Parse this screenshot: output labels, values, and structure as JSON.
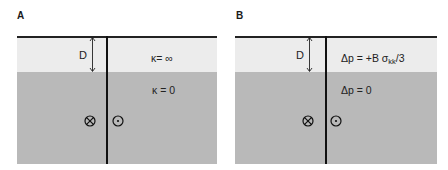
{
  "panels": [
    {
      "letter": "A",
      "depth_label": "D",
      "upper_layer_label": "κ= ∞",
      "lower_layer_label": "κ = 0",
      "into_page_symbol": "circled-x",
      "out_of_page_symbol": "circled-dot"
    },
    {
      "letter": "B",
      "depth_label": "D",
      "upper_layer_label_main": "Δp = +B σ",
      "upper_layer_label_sub": "kk",
      "upper_layer_label_tail": "/3",
      "lower_layer_label": "Δp = 0",
      "into_page_symbol": "circled-x",
      "out_of_page_symbol": "circled-dot"
    }
  ],
  "colors": {
    "upper_layer": "#ececec",
    "lower_layer": "#b9b9b9",
    "lines": "#111111"
  }
}
